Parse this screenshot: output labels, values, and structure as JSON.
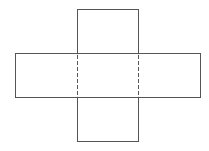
{
  "diagram": {
    "type": "net",
    "faces": [
      "top-face",
      "left-face",
      "center-face",
      "right-face",
      "bottom-face"
    ],
    "fold_lines": [
      "left-fold-line",
      "right-fold-line"
    ],
    "colors": {
      "stroke": "#555555",
      "background": "#ffffff"
    }
  }
}
